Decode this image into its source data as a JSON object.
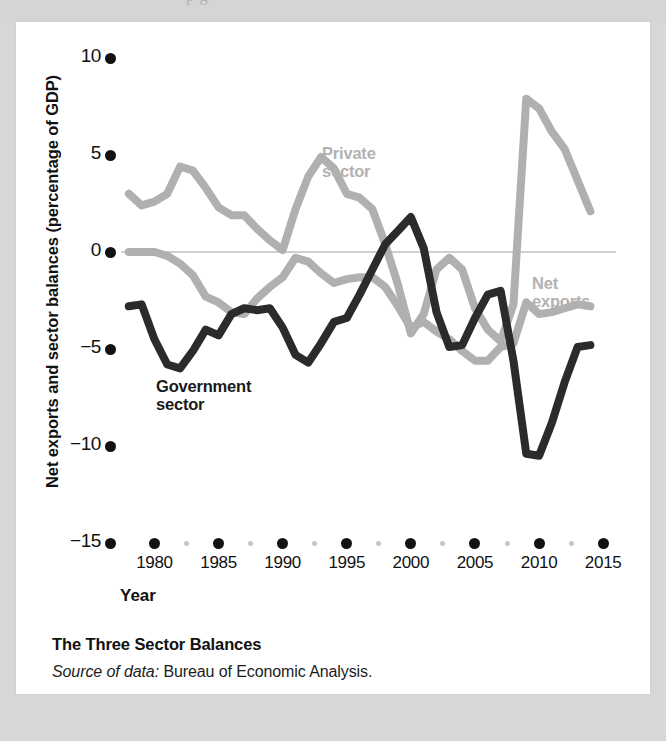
{
  "page": {
    "ghost_text_top": "p       g"
  },
  "figure": {
    "caption_title": "The Three Sector Balances",
    "source_prefix": "Source of data:",
    "source_text": "Bureau of Economic Analysis.",
    "panel_background": "#ffffff",
    "page_background": "#d7d7d7"
  },
  "labels": {
    "private": "Private\nsector",
    "private_line1": "Private",
    "private_line2": "sector",
    "net_exports_line1": "Net",
    "net_exports_line2": "exports",
    "government_line1": "Government",
    "government_line2": "sector"
  },
  "chart_data": {
    "type": "line",
    "title": "The Three Sector Balances",
    "xlabel": "Year",
    "ylabel": "Net exports and sector balances (percentage of GDP)",
    "xlim": [
      1977,
      2016
    ],
    "ylim": [
      -15,
      10
    ],
    "yticks": [
      10,
      5,
      0,
      -5,
      -10,
      -15
    ],
    "ytick_labels": [
      "10",
      "5",
      "0",
      "−5",
      "−10",
      "−15"
    ],
    "xticks": [
      1980,
      1985,
      1990,
      1995,
      2000,
      2005,
      2010,
      2015
    ],
    "xtick_labels": [
      "1980",
      "1985",
      "1990",
      "1995",
      "2000",
      "2005",
      "2010",
      "2015"
    ],
    "minor_xticks": [
      1982.5,
      1987.5,
      1992.5,
      1997.5,
      2002.5,
      2007.5,
      2012.5
    ],
    "grid": false,
    "zero_line": true,
    "legend_position": "inline-annotations",
    "colors": {
      "private_sector": "#b0b0b0",
      "net_exports": "#b0b0b0",
      "government_sector": "#2b2b2b",
      "zero_line": "#cfcfcf",
      "tick_major": "#111111",
      "tick_minor": "#c3c3c3"
    },
    "x": [
      1978,
      1979,
      1980,
      1981,
      1982,
      1983,
      1984,
      1985,
      1986,
      1987,
      1988,
      1989,
      1990,
      1991,
      1992,
      1993,
      1994,
      1995,
      1996,
      1997,
      1998,
      1999,
      2000,
      2001,
      2002,
      2003,
      2004,
      2005,
      2006,
      2007,
      2008,
      2009,
      2010,
      2011,
      2012,
      2013,
      2014
    ],
    "series": [
      {
        "name": "Private sector",
        "color": "#b0b0b0",
        "values": [
          3.0,
          2.4,
          2.6,
          3.0,
          4.4,
          4.2,
          3.3,
          2.3,
          1.9,
          1.9,
          1.2,
          0.6,
          0.1,
          2.2,
          3.9,
          4.9,
          4.3,
          3.0,
          2.8,
          2.2,
          0.4,
          -1.7,
          -4.2,
          -3.2,
          -0.9,
          -0.3,
          -0.9,
          -2.9,
          -4.0,
          -4.6,
          -2.7,
          7.9,
          7.4,
          6.2,
          5.3,
          3.7,
          2.1
        ]
      },
      {
        "name": "Net exports",
        "color": "#b0b0b0",
        "values": [
          0.0,
          0.0,
          0.0,
          -0.2,
          -0.6,
          -1.2,
          -2.3,
          -2.6,
          -3.1,
          -3.2,
          -2.4,
          -1.8,
          -1.3,
          -0.3,
          -0.5,
          -1.1,
          -1.6,
          -1.4,
          -1.3,
          -1.3,
          -1.8,
          -2.8,
          -3.9,
          -3.6,
          -4.1,
          -4.5,
          -5.1,
          -5.6,
          -5.6,
          -4.9,
          -4.7,
          -2.6,
          -3.2,
          -3.1,
          -2.9,
          -2.7,
          -2.8
        ]
      },
      {
        "name": "Government sector",
        "color": "#2b2b2b",
        "values": [
          -2.8,
          -2.7,
          -4.5,
          -5.8,
          -6.0,
          -5.1,
          -4.0,
          -4.3,
          -3.2,
          -2.9,
          -3.0,
          -2.9,
          -3.9,
          -5.3,
          -5.7,
          -4.7,
          -3.6,
          -3.4,
          -2.2,
          -0.9,
          0.4,
          1.1,
          1.8,
          0.2,
          -3.1,
          -4.9,
          -4.8,
          -3.4,
          -2.2,
          -2.0,
          -5.6,
          -10.4,
          -10.5,
          -8.8,
          -6.7,
          -4.9,
          -4.8
        ]
      }
    ]
  }
}
